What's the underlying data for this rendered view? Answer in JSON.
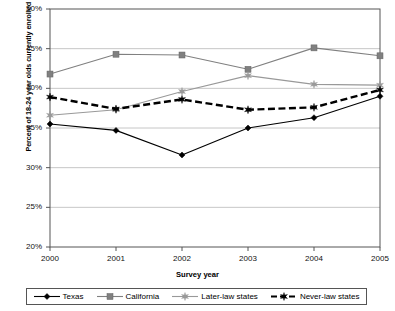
{
  "chart_data": {
    "type": "line",
    "title": "",
    "xlabel": "Survey year",
    "ylabel": "Percent of 18-24 year olds currently enrolled in college",
    "categories": [
      "2000",
      "2001",
      "2002",
      "2003",
      "2004",
      "2005"
    ],
    "x": [
      2000,
      2001,
      2002,
      2003,
      2004,
      2005
    ],
    "xlim": [
      2000,
      2005
    ],
    "ylim": [
      20,
      50
    ],
    "ytick_labels": [
      "20%",
      "25%",
      "30%",
      "35%",
      "40%",
      "45%",
      "50%"
    ],
    "ytick_values": [
      20,
      25,
      30,
      35,
      40,
      45,
      50
    ],
    "grid": true,
    "grid_axis": "y",
    "legend_position": "bottom",
    "series": [
      {
        "name": "Texas",
        "values": [
          35.5,
          34.7,
          31.6,
          35.0,
          36.3,
          39.0
        ],
        "color": "#000000",
        "marker": "diamond",
        "dash": "solid"
      },
      {
        "name": "California",
        "values": [
          41.8,
          44.3,
          44.2,
          42.4,
          45.1,
          44.1
        ],
        "color": "#808080",
        "marker": "square",
        "dash": "solid"
      },
      {
        "name": "Later-law states",
        "values": [
          36.6,
          37.3,
          39.6,
          41.6,
          40.5,
          40.4
        ],
        "color": "#999999",
        "marker": "star",
        "dash": "solid"
      },
      {
        "name": "Never-law states",
        "values": [
          38.9,
          37.4,
          38.6,
          37.3,
          37.6,
          39.8
        ],
        "color": "#000000",
        "marker": "star",
        "dash": "dashed"
      }
    ]
  },
  "legend": {
    "items": [
      {
        "label": "Texas"
      },
      {
        "label": "California"
      },
      {
        "label": "Later-law states"
      },
      {
        "label": "Never-law states"
      }
    ]
  },
  "axes": {
    "y_title": "Percent of 18-24 year olds currently enrolled in college",
    "x_title": "Survey year"
  }
}
